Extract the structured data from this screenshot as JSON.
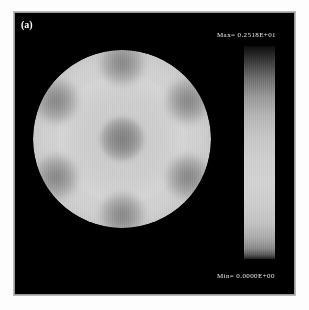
{
  "figure": {
    "panel_label": "(a)",
    "background_color": "#ffffff",
    "panel_color": "#000000",
    "frame_color": "#b9b9b9"
  },
  "colorbar": {
    "max_label": "Max=  0.2518E+01",
    "min_label": "Min=  0.0000E+00",
    "orientation": "vertical",
    "colormap": "grayscale",
    "text_color": "#e8e8e8"
  },
  "chart_data": {
    "type": "heatmap",
    "title": "(a)",
    "subtitle": "",
    "xlabel": "",
    "ylabel": "",
    "colormap": "grayscale",
    "grid": false,
    "legend_position": "right",
    "domain_shape": "circular-disc",
    "colorbar": {
      "min": 0.0,
      "max": 2.518,
      "min_text": "Min=  0.0000E+00",
      "max_text": "Max=  0.2518E+01"
    },
    "value_range": [
      0.0,
      2.518
    ],
    "annotations": [
      "circular disc domain on black background",
      "central low-intensity core",
      "six low-intensity lobes in hexagonal arrangement around periphery"
    ],
    "features": [
      {
        "name": "central-core",
        "x": 0.0,
        "y": 0.0,
        "radius": 0.25,
        "relative_value": 0.62
      },
      {
        "name": "lobe-n",
        "x": 0.0,
        "y": 0.86,
        "angle_deg": 90,
        "radius": 0.26,
        "relative_value": 0.55
      },
      {
        "name": "lobe-ne",
        "x": 0.745,
        "y": 0.43,
        "angle_deg": 30,
        "radius": 0.26,
        "relative_value": 0.6
      },
      {
        "name": "lobe-se",
        "x": 0.745,
        "y": -0.43,
        "angle_deg": -30,
        "radius": 0.26,
        "relative_value": 0.62
      },
      {
        "name": "lobe-s",
        "x": 0.0,
        "y": -0.86,
        "angle_deg": -90,
        "radius": 0.26,
        "relative_value": 0.66
      },
      {
        "name": "lobe-sw",
        "x": -0.745,
        "y": -0.43,
        "angle_deg": 210,
        "radius": 0.26,
        "relative_value": 0.6
      },
      {
        "name": "lobe-nw",
        "x": -0.745,
        "y": 0.43,
        "angle_deg": 150,
        "radius": 0.26,
        "relative_value": 0.56
      }
    ],
    "background_value": 0.0,
    "disc_plateau_relative_value": 0.84
  }
}
